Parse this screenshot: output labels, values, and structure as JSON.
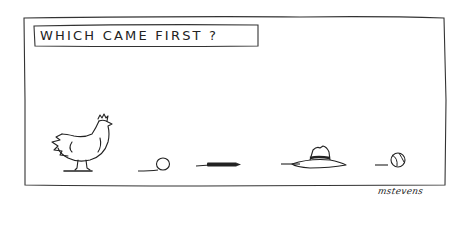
{
  "cartoon": {
    "caption": "WHICH CAME FIRST ?",
    "signature": "mstevens",
    "items": [
      {
        "name": "chicken"
      },
      {
        "name": "egg"
      },
      {
        "name": "pen"
      },
      {
        "name": "hat"
      },
      {
        "name": "baseball"
      }
    ],
    "colors": {
      "ink": "#222222",
      "paper": "#ffffff"
    }
  }
}
